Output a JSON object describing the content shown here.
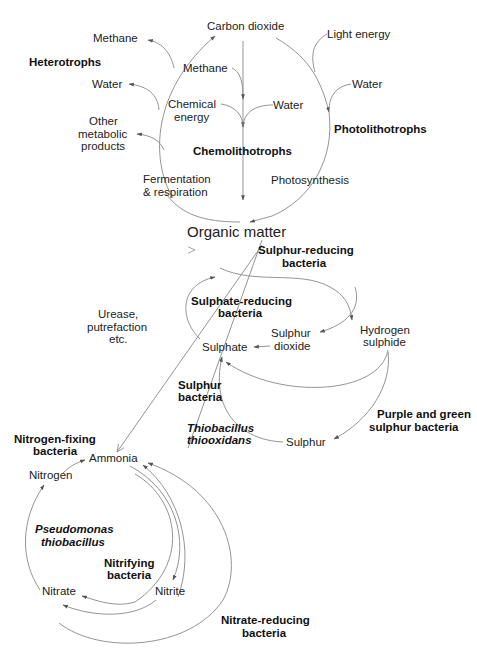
{
  "carbon_cycle": {
    "nodes": {
      "carbon_dioxide": "Carbon dioxide",
      "light_energy": "Light energy",
      "methane_out": "Methane",
      "methane_in": "Methane",
      "water_out": "Water",
      "water_chemo": "Water",
      "water_photo": "Water",
      "chemical_energy_1": "Chemical",
      "chemical_energy_2": "energy",
      "other_products_1": "Other",
      "other_products_2": "metabolic",
      "other_products_3": "products",
      "fermentation_1": "Fermentation",
      "fermentation_2": "& respiration",
      "photosynthesis": "Photosynthesis"
    },
    "groups": {
      "heterotrophs": "Heterotrophs",
      "chemolithotrophs": "Chemolithotrophs",
      "photolithotrophs": "Photolithotrophs"
    }
  },
  "center": {
    "organic_matter": "Organic matter",
    "urease_1": "Urease,",
    "urease_2": "putrefaction",
    "urease_3": "etc."
  },
  "sulphur_cycle": {
    "nodes": {
      "sulphur_dioxide_1": "Sulphur",
      "sulphur_dioxide_2": "dioxide",
      "hydrogen_sulphide_1": "Hydrogen",
      "hydrogen_sulphide_2": "sulphide",
      "sulphate": "Sulphate",
      "sulphur": "Sulphur"
    },
    "groups": {
      "sulphur_reducing_1": "Sulphur-reducing",
      "sulphur_reducing_2": "bacteria",
      "sulphate_reducing_1": "Sulphate-reducing",
      "sulphate_reducing_2": "bacteria",
      "sulphur_bacteria_1": "Sulphur",
      "sulphur_bacteria_2": "bacteria",
      "thiobacillus_1": "Thiobacillus",
      "thiobacillus_2": "thiooxidans",
      "purple_green_1": "Purple and green",
      "purple_green_2": "sulphur bacteria"
    }
  },
  "nitrogen_cycle": {
    "nodes": {
      "ammonia": "Ammonia",
      "nitrogen": "Nitrogen",
      "nitrate": "Nitrate",
      "nitrite": "Nitrite"
    },
    "groups": {
      "nitrogen_fixing_1": "Nitrogen-fixing",
      "nitrogen_fixing_2": "bacteria",
      "pseudomonas_1": "Pseudomonas",
      "pseudomonas_2": "thiobacillus",
      "nitrifying_1": "Nitrifying",
      "nitrifying_2": "bacteria",
      "nitrate_reducing_1": "Nitrate-reducing",
      "nitrate_reducing_2": "bacteria"
    }
  },
  "colors": {
    "line": "#888888",
    "text": "#222222",
    "background": "#ffffff"
  }
}
